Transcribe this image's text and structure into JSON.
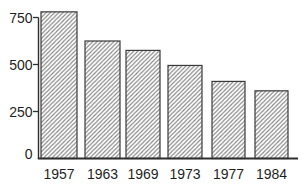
{
  "chart_data": {
    "type": "bar",
    "title": "",
    "xlabel": "",
    "ylabel": "",
    "categories": [
      "1957",
      "1963",
      "1969",
      "1973",
      "1977",
      "1984"
    ],
    "values": [
      780,
      625,
      575,
      495,
      410,
      360
    ],
    "yticks": [
      0,
      250,
      500,
      750
    ],
    "ylim": [
      0,
      800
    ],
    "grid": false,
    "legend_position": "none",
    "bar_style": {
      "fill": "#ffffff",
      "hatch": "diagonal-forward",
      "hatch_color": "#848484",
      "stroke": "#3a3a3a"
    },
    "axis_color": "#2e2e2e",
    "text_color": "#1f1f1f",
    "background": "#ffffff"
  }
}
